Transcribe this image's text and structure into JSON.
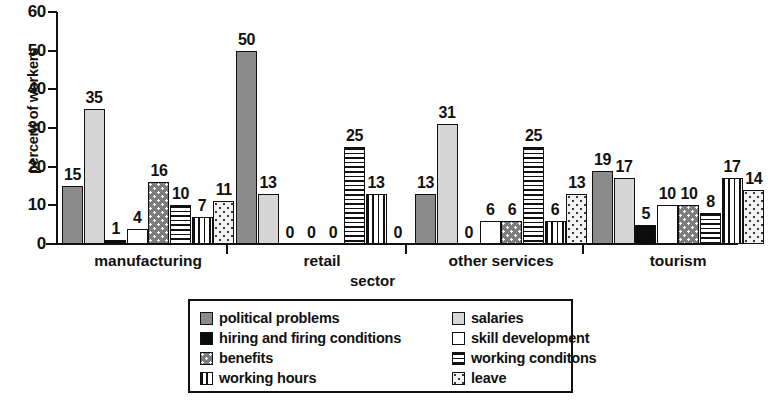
{
  "chart_data": {
    "type": "bar",
    "title": "",
    "xlabel": "sector",
    "ylabel": "percent of workers",
    "ylim": [
      0,
      60
    ],
    "yticks": [
      0,
      10,
      20,
      30,
      40,
      50,
      60
    ],
    "grid": false,
    "legend_position": "bottom",
    "categories": [
      "manufacturing",
      "retail",
      "other services",
      "tourism"
    ],
    "series": [
      {
        "name": "political problems",
        "key": "political",
        "values": [
          15,
          50,
          13,
          19
        ]
      },
      {
        "name": "salaries",
        "key": "salaries",
        "values": [
          35,
          13,
          31,
          17
        ]
      },
      {
        "name": "hiring and firing conditions",
        "key": "hiring",
        "values": [
          1,
          0,
          0,
          5
        ]
      },
      {
        "name": "skill development",
        "key": "skill",
        "values": [
          4,
          0,
          6,
          10
        ]
      },
      {
        "name": "benefits",
        "key": "benefits",
        "values": [
          16,
          0,
          6,
          10
        ]
      },
      {
        "name": "working conditons",
        "key": "conditions",
        "values": [
          10,
          25,
          25,
          8
        ]
      },
      {
        "name": "working hours",
        "key": "hours",
        "values": [
          7,
          13,
          6,
          17
        ]
      },
      {
        "name": "leave",
        "key": "leave",
        "values": [
          11,
          0,
          13,
          14
        ]
      }
    ]
  },
  "axes": {
    "y_title": "percent of workers",
    "x_title": "sector",
    "y_tick_labels": [
      "0",
      "10",
      "20",
      "30",
      "40",
      "50",
      "60"
    ],
    "group_labels": [
      "manufacturing",
      "retail",
      "other services",
      "tourism"
    ]
  },
  "legend": {
    "left_column": [
      {
        "label": "political problems",
        "key": "political"
      },
      {
        "label": "hiring and firing conditions",
        "key": "hiring"
      },
      {
        "label": "benefits",
        "key": "benefits"
      },
      {
        "label": "working hours",
        "key": "hours"
      }
    ],
    "right_column": [
      {
        "label": "salaries",
        "key": "salaries"
      },
      {
        "label": "skill development",
        "key": "skill"
      },
      {
        "label": "working conditons",
        "key": "conditions"
      },
      {
        "label": "leave",
        "key": "leave"
      }
    ]
  },
  "colors": {
    "political": "#8b8b8b",
    "salaries": "#d6d6d6",
    "hiring": "#0c0c0c",
    "skill": "#ffffff",
    "benefits": "#7d7d7d",
    "conditions": "#ffffff",
    "hours": "#ffffff",
    "leave": "#f2f2f2",
    "axis": "#111111",
    "background": "#ffffff"
  }
}
